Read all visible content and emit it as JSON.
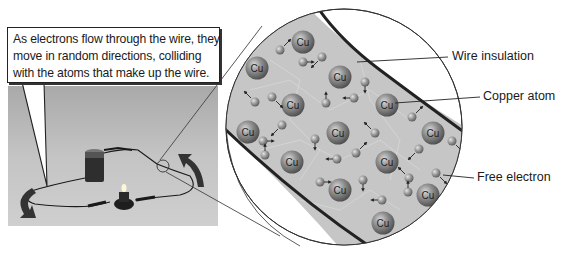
{
  "callout": {
    "lines": [
      "As electrons flow through the wire, they",
      "move in random directions, colliding",
      "with the atoms that make up the wire."
    ]
  },
  "labels": {
    "wire_insulation": "Wire insulation",
    "copper_atom": "Copper atom",
    "free_electron": "Free electron"
  },
  "atom_symbol": "Cu",
  "photo": {
    "description": "Circuit photo: battery, wires with clips, small bulb; curved arrows showing current direction",
    "arrow_count": 2
  },
  "magnifier": {
    "center": [
      344,
      127
    ],
    "radius": 118
  },
  "copper_atoms": [
    [
      303,
      42
    ],
    [
      257,
      68
    ],
    [
      340,
      77
    ],
    [
      293,
      105
    ],
    [
      387,
      105
    ],
    [
      248,
      132
    ],
    [
      338,
      133
    ],
    [
      433,
      133
    ],
    [
      292,
      162
    ],
    [
      387,
      162
    ],
    [
      340,
      190
    ],
    [
      428,
      195
    ],
    [
      383,
      223
    ]
  ],
  "free_electrons": [
    [
      280,
      50
    ],
    [
      322,
      57
    ],
    [
      303,
      62
    ],
    [
      365,
      82
    ],
    [
      255,
      102
    ],
    [
      272,
      97
    ],
    [
      326,
      103
    ],
    [
      354,
      98
    ],
    [
      412,
      117
    ],
    [
      282,
      125
    ],
    [
      263,
      141
    ],
    [
      315,
      139
    ],
    [
      375,
      133
    ],
    [
      452,
      141
    ],
    [
      265,
      155
    ],
    [
      337,
      159
    ],
    [
      356,
      153
    ],
    [
      419,
      149
    ],
    [
      320,
      182
    ],
    [
      363,
      180
    ],
    [
      409,
      178
    ],
    [
      436,
      173
    ],
    [
      408,
      192
    ],
    [
      382,
      200
    ]
  ],
  "colors": {
    "wire_fill": "#c9c9c9",
    "insulation_stroke": "#222222",
    "atom_fill": "#8a8a8a",
    "electron_fill": "#9a9a9a",
    "photo_bg": "#bdbdbd",
    "arrow": "#333333"
  }
}
